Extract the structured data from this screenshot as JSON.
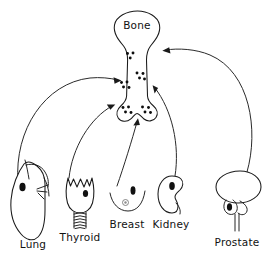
{
  "figure": {
    "background_color": "#ffffff",
    "ink_color": "#1a1a1a",
    "lesion_color": "#111111"
  },
  "target": {
    "name": "bone",
    "label": "Bone",
    "label_x": 137,
    "label_y": 29,
    "metastasis_dot_clusters": [
      {
        "cx": 130,
        "cy": 56,
        "count": 3
      },
      {
        "cx": 140,
        "cy": 76,
        "count": 4
      },
      {
        "cx": 124,
        "cy": 85,
        "count": 4
      },
      {
        "cx": 126,
        "cy": 110,
        "count": 4
      },
      {
        "cx": 146,
        "cy": 110,
        "count": 4
      }
    ]
  },
  "organs": [
    {
      "id": "lung",
      "label": "Lung",
      "label_x": 33,
      "label_y": 243,
      "has_lesion": true,
      "arrow_label": "lung-to-bone-arrow"
    },
    {
      "id": "thyroid",
      "label": "Thyroid",
      "label_x": 63,
      "label_y": 231,
      "has_lesion": true,
      "arrow_label": "thyroid-to-bone-arrow"
    },
    {
      "id": "breast",
      "label": "Breast",
      "label_x": 114,
      "label_y": 225,
      "has_lesion": true,
      "arrow_label": "breast-to-bone-arrow"
    },
    {
      "id": "kidney",
      "label": "Kidney",
      "label_x": 157,
      "label_y": 225,
      "has_lesion": true,
      "arrow_label": "kidney-to-bone-arrow"
    },
    {
      "id": "prostate",
      "label": "Prostate",
      "label_x": 212,
      "label_y": 235,
      "has_lesion": true,
      "arrow_label": "prostate-to-bone-arrow"
    }
  ]
}
